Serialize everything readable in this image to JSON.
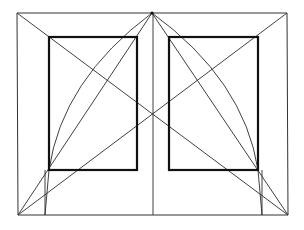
{
  "diagram": {
    "title": "",
    "colors": {
      "background": "#ffffff",
      "line": "#2a2a2a",
      "thick_line": "#111111"
    },
    "points": {
      "apex": [
        152,
        13
      ],
      "outer_top_left": [
        17,
        13
      ],
      "outer_top_right": [
        287,
        13
      ],
      "outer_bottom_left": [
        18,
        215
      ],
      "outer_bottom_right": [
        288,
        215
      ],
      "center_bottom": [
        153,
        215
      ],
      "center_crossing": [
        153,
        114
      ]
    },
    "outer_frame": {
      "x1": 17,
      "y1": 13,
      "x2": 288,
      "y2": 215
    },
    "inner_rects": [
      {
        "name": "left-panel",
        "x": 49,
        "y": 37,
        "width": 88,
        "height": 133
      },
      {
        "name": "right-panel",
        "x": 169,
        "y": 37,
        "width": 89,
        "height": 133
      }
    ],
    "vertical_lines": [
      {
        "name": "left-tick",
        "x": 45,
        "y1": 170,
        "y2": 215
      },
      {
        "name": "center-axis",
        "x": 153,
        "y1": 13,
        "y2": 215
      },
      {
        "name": "right-tick",
        "x": 262,
        "y1": 170,
        "y2": 215
      }
    ],
    "diagonals": [
      {
        "name": "main-diagonal-tl-br",
        "from": [
          17,
          13
        ],
        "to": [
          288,
          215
        ]
      },
      {
        "name": "main-diagonal-bl-tr",
        "from": [
          18,
          215
        ],
        "to": [
          287,
          13
        ]
      },
      {
        "name": "apex-to-bottom-left",
        "from": [
          152,
          13
        ],
        "to": [
          18,
          215
        ]
      },
      {
        "name": "apex-to-bottom-right",
        "from": [
          152,
          13
        ],
        "to": [
          288,
          215
        ]
      },
      {
        "name": "apex-to-left-inner-top",
        "from": [
          152,
          13
        ],
        "to": [
          49,
          37
        ]
      },
      {
        "name": "apex-to-right-inner-top",
        "from": [
          152,
          13
        ],
        "to": [
          258,
          37
        ]
      }
    ],
    "arcs": [
      {
        "name": "left-arc",
        "from": [
          152,
          13
        ],
        "to": [
          45,
          215
        ]
      },
      {
        "name": "right-arc",
        "from": [
          152,
          13
        ],
        "to": [
          262,
          215
        ]
      }
    ]
  }
}
